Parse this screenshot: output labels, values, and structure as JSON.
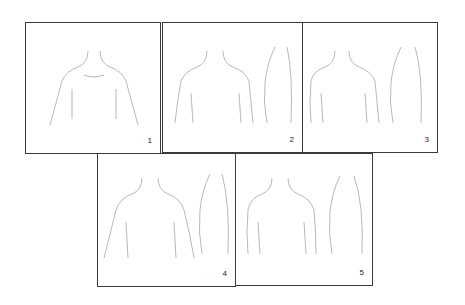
{
  "diagram": {
    "type": "staged line-illustration series",
    "panels": [
      {
        "id": 1,
        "label": "1",
        "views": [
          "front"
        ]
      },
      {
        "id": 2,
        "label": "2",
        "views": [
          "front",
          "side"
        ]
      },
      {
        "id": 3,
        "label": "3",
        "views": [
          "front",
          "side"
        ]
      },
      {
        "id": 4,
        "label": "4",
        "views": [
          "front",
          "side"
        ]
      },
      {
        "id": 5,
        "label": "5",
        "views": [
          "front",
          "side"
        ]
      }
    ],
    "colors": {
      "line": "#9a9a9a",
      "border": "#3a3a3a",
      "background": "#ffffff",
      "label": "#222222"
    }
  }
}
